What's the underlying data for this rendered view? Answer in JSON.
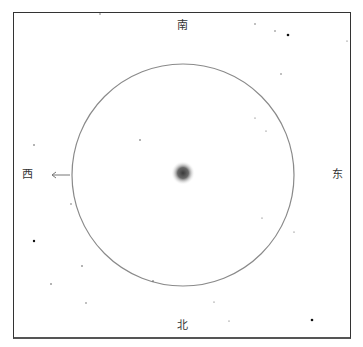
{
  "diagram": {
    "type": "star-chart",
    "directions": {
      "top": "南",
      "bottom": "北",
      "left": "西",
      "right": "东"
    },
    "circle": {
      "cx": 183,
      "cy": 175,
      "r": 111,
      "stroke": "#8a8a8a"
    },
    "center_object": {
      "cx": 183,
      "cy": 173,
      "r": 12,
      "color": "#444444"
    },
    "arrow": {
      "from_x": 70,
      "to_x": 52,
      "y": 175,
      "direction": "west",
      "color": "#777777"
    },
    "frame_color": "#333333",
    "stars": [
      {
        "x": 100,
        "y": 14,
        "r": 0.7
      },
      {
        "x": 255,
        "y": 24,
        "r": 0.7
      },
      {
        "x": 275,
        "y": 31,
        "r": 0.7
      },
      {
        "x": 288,
        "y": 35,
        "r": 1.3
      },
      {
        "x": 347,
        "y": 41,
        "r": 0.6
      },
      {
        "x": 281,
        "y": 74,
        "r": 0.7
      },
      {
        "x": 140,
        "y": 140,
        "r": 0.8
      },
      {
        "x": 255,
        "y": 118,
        "r": 0.6
      },
      {
        "x": 266,
        "y": 131,
        "r": 0.6
      },
      {
        "x": 34,
        "y": 145,
        "r": 0.8
      },
      {
        "x": 71,
        "y": 204,
        "r": 0.7
      },
      {
        "x": 34,
        "y": 241,
        "r": 1.2
      },
      {
        "x": 82,
        "y": 266,
        "r": 0.8
      },
      {
        "x": 51,
        "y": 284,
        "r": 0.8
      },
      {
        "x": 86,
        "y": 303,
        "r": 0.7
      },
      {
        "x": 153,
        "y": 281,
        "r": 0.8
      },
      {
        "x": 262,
        "y": 218,
        "r": 0.6
      },
      {
        "x": 294,
        "y": 232,
        "r": 0.6
      },
      {
        "x": 214,
        "y": 302,
        "r": 0.6
      },
      {
        "x": 229,
        "y": 321,
        "r": 0.6
      },
      {
        "x": 312,
        "y": 320,
        "r": 1.3
      }
    ]
  }
}
